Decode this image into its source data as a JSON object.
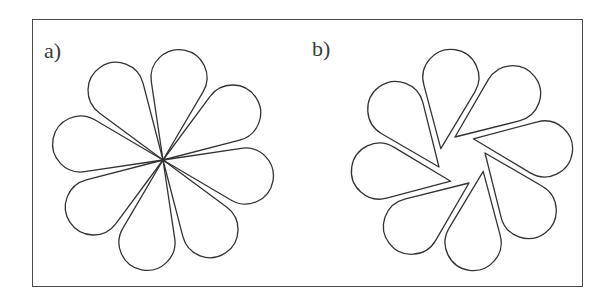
{
  "figure": {
    "panels": [
      {
        "label": "a)",
        "description": "Eight teardrop petals all meeting at a single common center point",
        "center": [
          163,
          160
        ],
        "petal_count": 8,
        "start_angle_deg": -79,
        "tip_offset": 0,
        "tip_offset_angle_deg": 0,
        "petal_length": 112,
        "bulb_radius": 28
      },
      {
        "label": "b)",
        "description": "Eight teardrop petals with tips displaced from center, forming a pinwheel around an open central region",
        "center": [
          462,
          160
        ],
        "petal_count": 8,
        "start_angle_deg": -82,
        "tip_offset": 24,
        "tip_offset_angle_deg": 70,
        "petal_length": 100,
        "bulb_radius": 28
      }
    ],
    "colors": {
      "stroke": "#333333",
      "frame": "#4a4a4a",
      "background": "#ffffff"
    }
  }
}
